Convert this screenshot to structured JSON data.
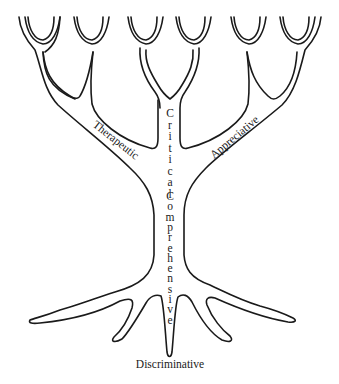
{
  "diagram": {
    "type": "tree-of-listening",
    "labels": {
      "left_branch": "Therapeutic",
      "right_branch": "Appreciative",
      "upper_trunk": "Critical",
      "lower_trunk": "Comprehensive",
      "roots": "Discriminative"
    },
    "colors": {
      "line": "#1a1a1a",
      "background": "#ffffff"
    }
  }
}
